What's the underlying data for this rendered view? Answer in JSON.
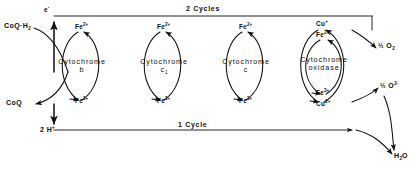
{
  "figure": {
    "type": "electron-transport-chain-diagram",
    "cycles": [
      {
        "id": "cytochrome-b",
        "name_line1": "Cytochrome",
        "name_line2": "b",
        "oxidized_state": "Fe",
        "oxidized_charge": "3+",
        "reduced_state": "Fe",
        "reduced_charge": "2+"
      },
      {
        "id": "cytochrome-c1",
        "name_line1": "Cytochrome",
        "name_line2": "c",
        "name_sub": "1",
        "oxidized_state": "Fe",
        "oxidized_charge": "3+",
        "reduced_state": "Fe",
        "reduced_charge": "2+"
      },
      {
        "id": "cytochrome-c",
        "name_line1": "Cytochrome",
        "name_line2": "c",
        "oxidized_state": "Fe",
        "oxidized_charge": "3+",
        "reduced_state": "Fe",
        "reduced_charge": "2+"
      },
      {
        "id": "cytochrome-oxidase",
        "name_line1": "Cytochrome",
        "name_line2": "oxidase",
        "oxidized_state": "Fe",
        "oxidized_charge": "3+",
        "reduced_state": "Fe",
        "reduced_charge": "2+",
        "copper_reduced": "Cu",
        "copper_reduced_charge": "+",
        "copper_oxidized": "Cu",
        "copper_oxidized_charge": "2+"
      }
    ],
    "labels": {
      "electron": "e",
      "electron_charge": "-",
      "top_path": "2 Cycles",
      "bottom_path": "1 Cycle",
      "coq_reduced": "CoQ·H",
      "coq_reduced_sub": "2",
      "coq_oxidized": "CoQ",
      "protons": "2 H",
      "protons_charge": "+",
      "oxygen": "O",
      "oxygen_sub": "2",
      "oxygen_half": "½",
      "oxide": "O",
      "oxide_charge": "2-",
      "oxide_half": "½",
      "water": "H",
      "water_sub": "2",
      "water_tail": "O"
    },
    "colors": {
      "ink": "#0d0d0d",
      "background": "#ffffff"
    }
  }
}
